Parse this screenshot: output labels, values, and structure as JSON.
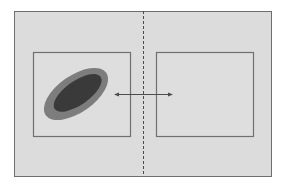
{
  "diagram": {
    "colors": {
      "background": "#ffffff",
      "frame_fill": "#dcdcdc",
      "frame_stroke": "#6e6e6e",
      "box_stroke": "#707070",
      "divider": "#4a4a4a",
      "ellipse_outer": "#7d7d7d",
      "ellipse_inner": "#3a3a3a",
      "arrow": "#4d4d4d"
    },
    "frame": {
      "x": 14,
      "y": 11,
      "w": 257,
      "h": 165
    },
    "divider": {
      "x": 143,
      "y1": 11,
      "y2": 176,
      "style": "dashed"
    },
    "left_box": {
      "x": 33,
      "y": 52,
      "w": 97,
      "h": 84
    },
    "right_box": {
      "x": 156,
      "y": 52,
      "w": 97,
      "h": 84
    },
    "ellipse": {
      "cx": 76,
      "cy": 94,
      "outer_rx": 37,
      "outer_ry": 19,
      "inner_rx": 28,
      "inner_ry": 12,
      "rotation_deg": -35
    },
    "arrow": {
      "x1": 115,
      "x2": 172,
      "y": 94,
      "heads": "both"
    }
  }
}
